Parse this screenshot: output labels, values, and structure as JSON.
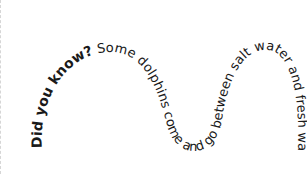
{
  "graphic": {
    "title": "Curved text fact",
    "lead_text": "Did you know?",
    "body_text": " Some dolphins come and go between salt water and fresh water.",
    "text_color": "#1a1a1a",
    "background": "#ffffff"
  }
}
